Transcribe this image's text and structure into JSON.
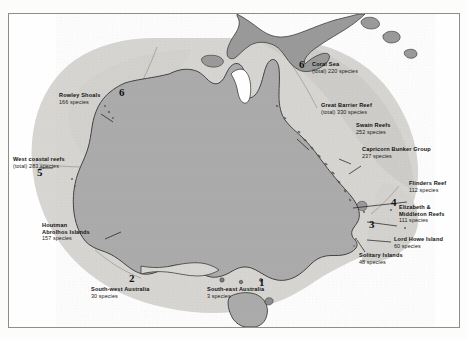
{
  "page": {
    "top_text_fragment": "g  h  p        j     s   d           c       h        n             l        e",
    "figure_title": "Coral reef biodiversity zones of Australia"
  },
  "map": {
    "region": "Australia",
    "colors": {
      "land": "#ababab",
      "land_dark": "#9a9a9a",
      "reef_zone": "#d8d6d2",
      "reef_zone_dark": "#c9c7c3",
      "ocean": "#ffffff",
      "coastline": "#2a2a2a",
      "frame": "#8e8e8e"
    },
    "landmasses": [
      {
        "name": "Australia mainland",
        "shade": "land"
      },
      {
        "name": "Tasmania",
        "shade": "land"
      },
      {
        "name": "New Guinea",
        "shade": "land_dark"
      }
    ],
    "zones": [
      {
        "number": "1",
        "name": "South-east Australia"
      },
      {
        "number": "2",
        "name": "South-west Australia"
      },
      {
        "number": "3",
        "name": "Solitary Islands province"
      },
      {
        "number": "4",
        "name": "Lord Howe / Elizabeth & Middleton province"
      },
      {
        "number": "5",
        "name": "West coastal reefs"
      },
      {
        "number": "6",
        "name": "Tropical northern province"
      }
    ],
    "labels": [
      {
        "id": "rowley-shoals",
        "title": "Rowley Shoals",
        "species": "166 species"
      },
      {
        "id": "coral-sea",
        "title": "Coral Sea",
        "species": "(total) 220 species"
      },
      {
        "id": "great-barrier-reef",
        "title": "Great Barrier Reef",
        "species": "(total) 330 species"
      },
      {
        "id": "swain-reefs",
        "title": "Swain Reefs",
        "species": "252 species"
      },
      {
        "id": "capricorn-bunker",
        "title": "Capricorn Bunker Group",
        "species": "237 species"
      },
      {
        "id": "west-coastal-reefs",
        "title": "West coastal reefs",
        "species": "(total) 283 species"
      },
      {
        "id": "flinders-reef",
        "title": "Flinders Reef",
        "species": "112 species"
      },
      {
        "id": "elizabeth-middleton",
        "title": "Elizabeth &",
        "title2": "Middleton Reefs",
        "species": "111 species"
      },
      {
        "id": "houtman-abrolhos",
        "title": "Houtman",
        "title2": "Abrolhos Islands",
        "species": "157 species"
      },
      {
        "id": "lord-howe-island",
        "title": "Lord Howe Island",
        "species": "60 species"
      },
      {
        "id": "solitary-islands",
        "title": "Solitary Islands",
        "species": "48 species"
      },
      {
        "id": "south-west-australia",
        "title": "South-west Australia",
        "species": "30 species"
      },
      {
        "id": "south-east-australia",
        "title": "South-east Australia",
        "species": "3 species"
      }
    ]
  }
}
